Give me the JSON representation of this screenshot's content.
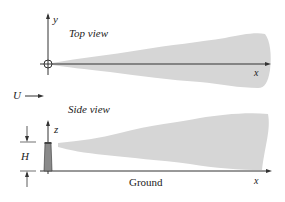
{
  "diagram": {
    "top_view": {
      "title": "Top view",
      "y_axis_label": "y",
      "x_axis_label": "x"
    },
    "wind": {
      "label": "U"
    },
    "side_view": {
      "title": "Side view",
      "z_axis_label": "z",
      "x_axis_label": "x",
      "height_label": "H",
      "ground_label": "Ground"
    },
    "colors": {
      "plume": "#d6d6d6",
      "stack": "#8a8a8a",
      "axis": "#333333"
    }
  }
}
